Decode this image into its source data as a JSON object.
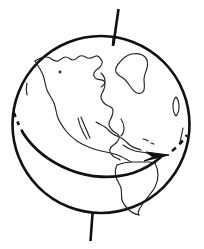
{
  "figure": {
    "title": "Earth globe with rotation axis and equatorial rotation arrow",
    "kind": "line-drawing",
    "background_color": "#ffffff",
    "ink_color": "#111111",
    "width": 204,
    "height": 249
  },
  "globe": {
    "label": "globe-outline",
    "center_x": 101,
    "center_y": 124,
    "radius": 89,
    "stroke_color": "#111111",
    "stroke_width": 2.6
  },
  "axis": {
    "label": "rotation-axis",
    "top_x": 118,
    "top_y": 9,
    "bottom_x": 94,
    "bottom_y": 241,
    "stroke_color": "#111111",
    "stroke_width": 2.6,
    "tilt_note": "tilted-axis"
  },
  "equator": {
    "label": "equator-rotation-arrow",
    "stroke_color": "#111111",
    "stroke_width": 2.8,
    "direction": "west-to-east",
    "arrow_tip_x": 168,
    "arrow_tip_y": 156,
    "dashed_segments": [
      "left-limb",
      "right-limb"
    ]
  },
  "landmasses": [
    {
      "name": "north-america"
    },
    {
      "name": "greenland"
    },
    {
      "name": "south-america"
    },
    {
      "name": "central-america"
    },
    {
      "name": "baja-california"
    },
    {
      "name": "caribbean-islands"
    }
  ]
}
